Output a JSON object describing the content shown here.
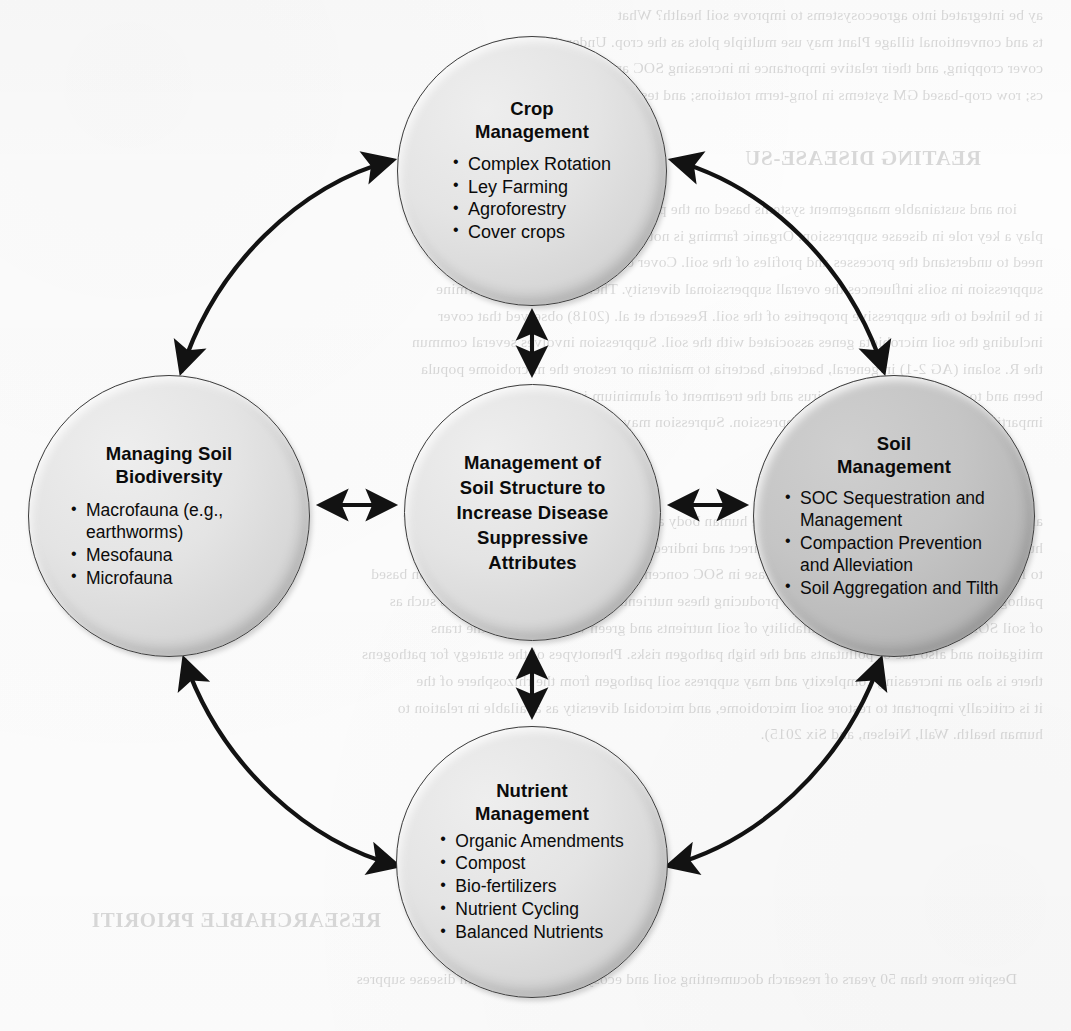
{
  "diagram": {
    "type": "hub-and-spoke-cycle",
    "center": {
      "id": "soil-structure",
      "title": "Management of Soil Structure to Increase Disease Suppressive Attributes",
      "title_lines": [
        "Management of",
        "Soil Structure to",
        "Increase Disease",
        "Suppressive",
        "Attributes"
      ],
      "fill": "#e0e0e0",
      "items": []
    },
    "nodes": [
      {
        "id": "crop-management",
        "title": "Crop Management",
        "title_lines": [
          "Crop",
          "Management"
        ],
        "position": "top",
        "fill": "#e0e0e0",
        "items": [
          "Complex Rotation",
          "Ley Farming",
          "Agroforestry",
          "Cover crops"
        ]
      },
      {
        "id": "managing-soil-biodiversity",
        "title": "Managing Soil Biodiversity",
        "title_lines": [
          "Managing Soil",
          "Biodiversity"
        ],
        "position": "left",
        "fill": "#e0e0e0",
        "items": [
          "Macrofauna (e.g., earthworms)",
          "Mesofauna",
          "Microfauna"
        ]
      },
      {
        "id": "soil-management",
        "title": "Soil Management",
        "title_lines": [
          "Soil",
          "Management"
        ],
        "position": "right",
        "fill": "#bcbcbc",
        "items": [
          "SOC Sequestration and Management",
          "Compaction Prevention and Alleviation",
          "Soil Aggregation and Tilth"
        ]
      },
      {
        "id": "nutrient-management",
        "title": "Nutrient Management",
        "title_lines": [
          "Nutrient",
          "Management"
        ],
        "position": "bottom",
        "fill": "#e0e0e0",
        "items": [
          "Organic Amendments",
          "Compost",
          "Bio-fertilizers",
          "Nutrient Cycling",
          "Balanced Nutrients"
        ]
      }
    ],
    "connectors": [
      {
        "id": "center-to-crop",
        "from": "soil-structure",
        "to": "crop-management",
        "style": "straight",
        "heads": "both"
      },
      {
        "id": "center-to-biodiversity",
        "from": "soil-structure",
        "to": "managing-soil-biodiversity",
        "style": "straight",
        "heads": "both"
      },
      {
        "id": "center-to-soil",
        "from": "soil-structure",
        "to": "soil-management",
        "style": "straight",
        "heads": "both"
      },
      {
        "id": "center-to-nutrient",
        "from": "soil-structure",
        "to": "nutrient-management",
        "style": "straight",
        "heads": "both"
      },
      {
        "id": "crop-to-biodiversity",
        "from": "crop-management",
        "to": "managing-soil-biodiversity",
        "style": "curved",
        "heads": "both"
      },
      {
        "id": "crop-to-soil",
        "from": "crop-management",
        "to": "soil-management",
        "style": "curved",
        "heads": "both"
      },
      {
        "id": "biodiversity-to-nutrient",
        "from": "managing-soil-biodiversity",
        "to": "nutrient-management",
        "style": "curved",
        "heads": "both"
      },
      {
        "id": "soil-to-nutrient",
        "from": "soil-management",
        "to": "nutrient-management",
        "style": "curved",
        "heads": "both"
      }
    ],
    "colors": {
      "outline": "#3d3d3d",
      "arrow": "#121212",
      "fill_light": "#e0e0e0",
      "fill_dark": "#bcbcbc",
      "text": "#0b0b0b",
      "page": "#fdfdfd"
    }
  },
  "background_scan": {
    "description": "Faint mirrored show-through text from the reverse side of the scanned page",
    "heading": "REATING DISEASE-SU",
    "section_heading": "RESEARCHABLE PRIORITI",
    "lines_top": [
      "ay be integrated into agroecosystems to improve soil health? What",
      "ts and conventional tillage Plant may use multiple plots as the crop. Under tills",
      "cover cropping, and their relative importance in increasing SOC and disease supp",
      "cs; row crop-based GM systems in long-term rotations; and testing cultivar plant pathoge"
    ],
    "lines_mid": [
      "ion and sustainable management systems based on the principles of e",
      "play a key role in disease suppression. Organic farming is not a monoculture of crops and the",
      "need to understand the processes and profiles of the soil. Cover cropping may enhance",
      "suppression in soils influences the overall supperssional diversity. There is a need to determine",
      "it be linked to the suppressive properties of the soil. Research et al. (2018) observed that cover",
      "including the soil microbiota genes associated with the soil. Suppression involves several commun",
      "the R. solani (AG 2-1) in general, bacteria, bacteria to maintain or restore the microbiome popula",
      "been and to a lesser extent of the virus and the treatment of aluminium in the soil",
      "imparting pathogen-induced disease suppression. Supression may apply to an extreme comp"
    ],
    "lines_low": [
      "al to human health and give to understand the human body and crop health to maintain the ability of",
      "human health. Glycosides in soil also have direct and indirect biological immunity health face on",
      "to Inorganic et al. (de Hannah). These increase in SOC concentration leads to lands and alternation based",
      "pathogens and pathogenic. In addition to producing these nutrients for increases local biomass such as",
      "of soil SOM content and low bioavailability of soil nutrients and green water flows. In the trans",
      "mitigation and also use of pollutants and the high pathogen risks. Phenotypes of the strategy for pathogens",
      "there is also an increasing complexity and may suppress soil pathogen from the rhizosphere of the",
      "it is critically important to restore soil microbiome, and microbial diversity as available in relation to",
      "human health. Wall, Nielsen, and Six 2015)."
    ],
    "lines_bottom": [
      "Despite more than 50 years of research documenting soil and ecosystem suppression in disease suppres"
    ]
  }
}
